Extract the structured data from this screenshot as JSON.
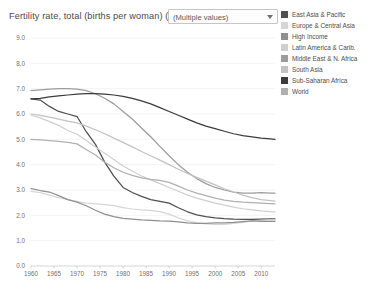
{
  "header": {
    "title": "Fertility rate, total (births per woman) (TFR)",
    "filter": {
      "value": "(Multiple values)",
      "caret": "chevron-down-icon"
    }
  },
  "legend": {
    "items": [
      {
        "label": "East Asia & Pacific",
        "color": "#4f4f4f"
      },
      {
        "label": "Europe & Central Asia",
        "color": "#d6d6d6"
      },
      {
        "label": "High Income",
        "color": "#8f8f8f"
      },
      {
        "label": "Latin America & Carib.",
        "color": "#cfcfcf"
      },
      {
        "label": "Middle East & N. Africa",
        "color": "#9c9c9c"
      },
      {
        "label": "South Asia",
        "color": "#c2c2c2"
      },
      {
        "label": "Sub-Saharan Africa",
        "color": "#3b3b3b"
      },
      {
        "label": "World",
        "color": "#b0b0b0"
      }
    ]
  },
  "chart_data": {
    "type": "line",
    "title": "Fertility rate, total (births per woman) (TFR)",
    "xlabel": "",
    "ylabel": "",
    "xlim": [
      1960,
      2013
    ],
    "ylim": [
      0.0,
      9.0
    ],
    "grid": true,
    "legend_position": "right",
    "x_ticks": [
      1960,
      1965,
      1970,
      1975,
      1980,
      1985,
      1990,
      1995,
      2000,
      2005,
      2010
    ],
    "y_ticks": [
      "0.0",
      "1.0",
      "2.0",
      "3.0",
      "4.0",
      "5.0",
      "6.0",
      "7.0",
      "8.0",
      "9.0"
    ],
    "x": [
      1960,
      1962,
      1964,
      1966,
      1968,
      1970,
      1972,
      1974,
      1976,
      1978,
      1980,
      1982,
      1984,
      1986,
      1988,
      1990,
      1992,
      1994,
      1996,
      1998,
      2000,
      2002,
      2004,
      2006,
      2008,
      2010,
      2012,
      2013
    ],
    "series": [
      {
        "name": "East Asia & Pacific",
        "color": "#4f4f4f",
        "values": [
          6.6,
          6.55,
          6.3,
          6.1,
          6.0,
          5.9,
          5.3,
          4.8,
          4.1,
          3.55,
          3.1,
          2.9,
          2.75,
          2.62,
          2.55,
          2.48,
          2.3,
          2.14,
          2.02,
          1.95,
          1.9,
          1.87,
          1.85,
          1.84,
          1.84,
          1.85,
          1.86,
          1.86
        ]
      },
      {
        "name": "Europe & Central Asia",
        "color": "#d6d6d6",
        "values": [
          2.95,
          2.9,
          2.8,
          2.7,
          2.62,
          2.55,
          2.48,
          2.45,
          2.42,
          2.38,
          2.3,
          2.25,
          2.22,
          2.2,
          2.15,
          2.05,
          1.9,
          1.78,
          1.7,
          1.66,
          1.64,
          1.64,
          1.68,
          1.72,
          1.78,
          1.8,
          1.82,
          1.82
        ]
      },
      {
        "name": "High Income",
        "color": "#8f8f8f",
        "values": [
          3.05,
          2.98,
          2.92,
          2.78,
          2.62,
          2.52,
          2.38,
          2.2,
          2.05,
          1.95,
          1.88,
          1.85,
          1.82,
          1.8,
          1.78,
          1.77,
          1.74,
          1.7,
          1.68,
          1.68,
          1.7,
          1.7,
          1.72,
          1.75,
          1.78,
          1.76,
          1.76,
          1.76
        ]
      },
      {
        "name": "Latin America & Carib.",
        "color": "#cfcfcf",
        "values": [
          5.95,
          5.85,
          5.7,
          5.55,
          5.35,
          5.2,
          4.95,
          4.7,
          4.45,
          4.2,
          3.95,
          3.75,
          3.55,
          3.4,
          3.25,
          3.1,
          2.95,
          2.8,
          2.68,
          2.58,
          2.48,
          2.4,
          2.32,
          2.26,
          2.22,
          2.18,
          2.15,
          2.14
        ]
      },
      {
        "name": "Middle East & N. Africa",
        "color": "#9c9c9c",
        "values": [
          6.92,
          6.95,
          6.98,
          7.0,
          7.0,
          6.98,
          6.92,
          6.8,
          6.62,
          6.4,
          6.1,
          5.8,
          5.45,
          5.1,
          4.72,
          4.35,
          4.0,
          3.7,
          3.45,
          3.25,
          3.1,
          3.0,
          2.92,
          2.88,
          2.88,
          2.9,
          2.88,
          2.88
        ]
      },
      {
        "name": "South Asia",
        "color": "#c2c2c2",
        "values": [
          6.0,
          5.95,
          5.88,
          5.8,
          5.72,
          5.65,
          5.52,
          5.38,
          5.22,
          5.05,
          4.88,
          4.7,
          4.52,
          4.35,
          4.18,
          4.0,
          3.82,
          3.65,
          3.5,
          3.35,
          3.2,
          3.05,
          2.92,
          2.8,
          2.7,
          2.62,
          2.58,
          2.56
        ]
      },
      {
        "name": "Sub-Saharan Africa",
        "color": "#3b3b3b",
        "values": [
          6.6,
          6.62,
          6.68,
          6.72,
          6.75,
          6.78,
          6.8,
          6.8,
          6.78,
          6.75,
          6.7,
          6.62,
          6.52,
          6.4,
          6.25,
          6.1,
          5.95,
          5.8,
          5.65,
          5.52,
          5.42,
          5.32,
          5.22,
          5.15,
          5.1,
          5.05,
          5.02,
          5.0
        ]
      },
      {
        "name": "World",
        "color": "#b0b0b0",
        "values": [
          5.0,
          4.98,
          4.95,
          4.92,
          4.88,
          4.82,
          4.6,
          4.38,
          4.1,
          3.88,
          3.7,
          3.58,
          3.48,
          3.42,
          3.38,
          3.3,
          3.15,
          3.0,
          2.88,
          2.78,
          2.68,
          2.6,
          2.55,
          2.52,
          2.5,
          2.48,
          2.46,
          2.45
        ]
      }
    ]
  }
}
